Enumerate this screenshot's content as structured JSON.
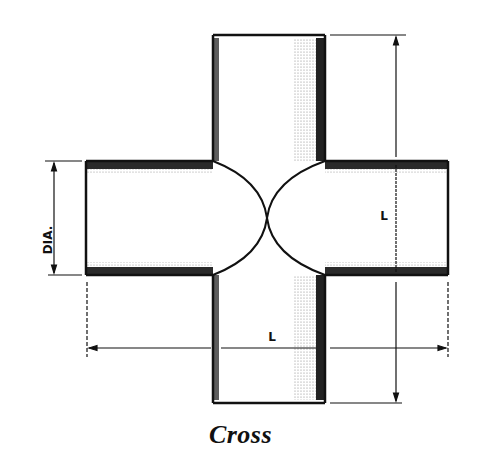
{
  "title": "Cross",
  "labels": {
    "diameter": "DIA.",
    "length_vertical": "L",
    "length_horizontal": "L"
  },
  "colors": {
    "ink": "#111111",
    "shade": "#9a9a9a",
    "background": "#ffffff"
  }
}
